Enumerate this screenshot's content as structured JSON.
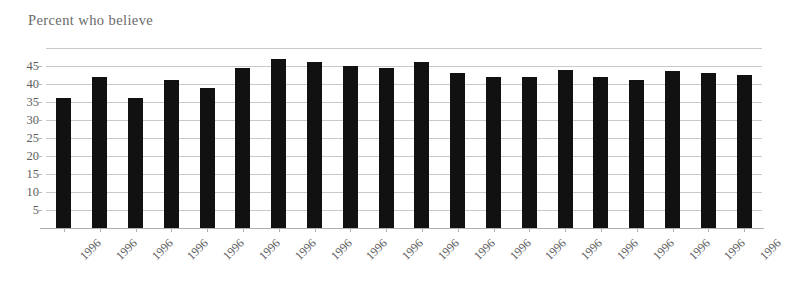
{
  "chart_data": {
    "type": "bar",
    "title": "Percent who believe",
    "xlabel": "",
    "ylabel": "",
    "grid": true,
    "legend": null,
    "ylim": [
      0,
      50
    ],
    "ytick_labels": [
      "5",
      "10",
      "15",
      "20",
      "25",
      "30",
      "35",
      "40",
      "45"
    ],
    "ytick_values": [
      5,
      10,
      15,
      20,
      25,
      30,
      35,
      40,
      45
    ],
    "categories": [
      "1996",
      "1996",
      "1996",
      "1996",
      "1996",
      "1996",
      "1996",
      "1996",
      "1996",
      "1996",
      "1996",
      "1996",
      "1996",
      "1996",
      "1996",
      "1996",
      "1996",
      "1996",
      "1996",
      "1996"
    ],
    "values": [
      36,
      42,
      36,
      41,
      39,
      44.5,
      47,
      46,
      45,
      44.5,
      46,
      43,
      42,
      42,
      44,
      42,
      41,
      43.5,
      43,
      42.5
    ],
    "bar_color": "#111111",
    "gridline_color": "#c9c9c9",
    "axis_color": "#b0b0b0",
    "label_color": "#5d5d5d",
    "background_color": "#ffffff"
  }
}
